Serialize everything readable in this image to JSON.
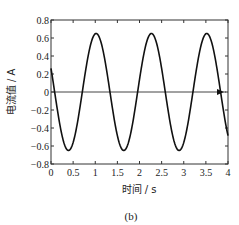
{
  "chart_data": {
    "type": "line",
    "title": "",
    "caption": "(b)",
    "xlabel": "时间 / s",
    "ylabel": "电流值 / A",
    "xlim": [
      0,
      4
    ],
    "ylim": [
      -0.8,
      0.8
    ],
    "xticks": [
      0,
      0.5,
      1,
      1.5,
      2,
      2.5,
      3,
      3.5,
      4
    ],
    "xtick_labels": [
      "0",
      "0.5",
      "1",
      "1.5",
      "2",
      "2.5",
      "3",
      "3.5",
      "4"
    ],
    "yticks": [
      -0.8,
      -0.6,
      -0.4,
      -0.2,
      0,
      0.2,
      0.4,
      0.6,
      0.8
    ],
    "ytick_labels": [
      "−0.8",
      "−0.6",
      "−0.4",
      "−0.2",
      "0",
      "0.2",
      "0.4",
      "0.6",
      "0.8"
    ],
    "grid": false,
    "zero_line_arrow": true,
    "series": [
      {
        "name": "current",
        "color": "#111111",
        "amplitude": 0.65,
        "frequency_hz": 0.8,
        "phase_rad": 2.727,
        "x": [
          0,
          0.1,
          0.2,
          0.3,
          0.4,
          0.5,
          0.6,
          0.7,
          0.8,
          0.9,
          1.0,
          1.1,
          1.2,
          1.3,
          1.4,
          1.5,
          1.6,
          1.7,
          1.8,
          1.9,
          2.0,
          2.1,
          2.2,
          2.3,
          2.4,
          2.5,
          2.6,
          2.7,
          2.8,
          2.9,
          3.0,
          3.1,
          3.2,
          3.3,
          3.4,
          3.5,
          3.6,
          3.7,
          3.8,
          3.9,
          4.0
        ],
        "y": [
          0.26,
          -0.07,
          -0.38,
          -0.59,
          -0.65,
          -0.54,
          -0.3,
          0.01,
          0.32,
          0.56,
          0.65,
          0.58,
          0.37,
          0.07,
          -0.25,
          -0.51,
          -0.64,
          -0.61,
          -0.43,
          -0.14,
          0.18,
          0.46,
          0.63,
          0.63,
          0.49,
          0.22,
          -0.1,
          -0.4,
          -0.6,
          -0.65,
          -0.53,
          -0.28,
          0.03,
          0.34,
          0.57,
          0.65,
          0.57,
          0.36,
          0.06,
          -0.26,
          -0.48
        ]
      }
    ]
  }
}
